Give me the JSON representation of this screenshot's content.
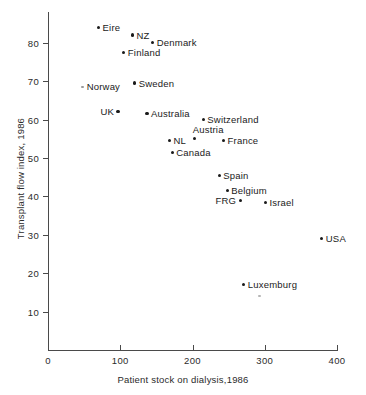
{
  "chart_data": {
    "type": "scatter",
    "title": "",
    "xlabel": "Patient stock on dialysis,1986",
    "ylabel": "Transplant flow index, 1986",
    "xlim": [
      0,
      400
    ],
    "ylim": [
      0,
      88
    ],
    "grid": false,
    "legend": "none",
    "xticks": [
      {
        "value": 0,
        "label": "0"
      },
      {
        "value": 100,
        "label": "100"
      },
      {
        "value": 200,
        "label": "200"
      },
      {
        "value": 300,
        "label": "300"
      },
      {
        "value": 400,
        "label": "400"
      }
    ],
    "yticks": [
      {
        "value": 10,
        "label": "10"
      },
      {
        "value": 20,
        "label": "20"
      },
      {
        "value": 30,
        "label": "30"
      },
      {
        "value": 40,
        "label": "40"
      },
      {
        "value": 50,
        "label": "50"
      },
      {
        "value": 60,
        "label": "60"
      },
      {
        "value": 70,
        "label": "70"
      },
      {
        "value": 80,
        "label": "80"
      }
    ],
    "points": [
      {
        "name": "Eire",
        "x": 70,
        "y": 84,
        "label_pos": "right",
        "faint": false
      },
      {
        "name": "NZ",
        "x": 117,
        "y": 82,
        "label_pos": "right",
        "faint": false
      },
      {
        "name": "Denmark",
        "x": 145,
        "y": 80,
        "label_pos": "right",
        "faint": false
      },
      {
        "name": "Finland",
        "x": 105,
        "y": 77.5,
        "label_pos": "right",
        "faint": false
      },
      {
        "name": "Norway",
        "x": 48,
        "y": 68.5,
        "label_pos": "right",
        "faint": true
      },
      {
        "name": "Sweden",
        "x": 120,
        "y": 69.5,
        "label_pos": "right",
        "faint": false
      },
      {
        "name": "UK",
        "x": 97,
        "y": 62,
        "label_pos": "left",
        "faint": false
      },
      {
        "name": "Australia",
        "x": 137,
        "y": 61.5,
        "label_pos": "right",
        "faint": false
      },
      {
        "name": "Switzerland",
        "x": 215,
        "y": 60,
        "label_pos": "right",
        "faint": false
      },
      {
        "name": "Austria",
        "x": 203,
        "y": 55,
        "label_pos": "above",
        "faint": false
      },
      {
        "name": "NL",
        "x": 168,
        "y": 54.5,
        "label_pos": "right",
        "faint": false
      },
      {
        "name": "France",
        "x": 243,
        "y": 54.5,
        "label_pos": "right",
        "faint": false
      },
      {
        "name": "Canada",
        "x": 172,
        "y": 51.5,
        "label_pos": "right",
        "faint": false
      },
      {
        "name": "Spain",
        "x": 237,
        "y": 45.5,
        "label_pos": "right",
        "faint": false
      },
      {
        "name": "Belgium",
        "x": 248,
        "y": 41.5,
        "label_pos": "right",
        "faint": false
      },
      {
        "name": "FRG",
        "x": 266,
        "y": 39,
        "label_pos": "left",
        "faint": false
      },
      {
        "name": "Israel",
        "x": 301,
        "y": 38.5,
        "label_pos": "right",
        "faint": false
      },
      {
        "name": "USA",
        "x": 379,
        "y": 29,
        "label_pos": "right",
        "faint": false
      },
      {
        "name": "Luxemburg",
        "x": 271,
        "y": 17,
        "label_pos": "right",
        "faint": false
      }
    ],
    "stray_marks": [
      {
        "x": 293,
        "y": 14
      }
    ]
  }
}
